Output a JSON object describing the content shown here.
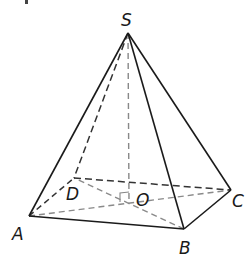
{
  "diagram": {
    "type": "square pyramid",
    "vertices": {
      "S": {
        "label": "S",
        "x": 128,
        "y": 33,
        "lx": 121,
        "ly": 26
      },
      "A": {
        "label": "A",
        "x": 29,
        "y": 216,
        "lx": 12,
        "ly": 240
      },
      "B": {
        "label": "B",
        "x": 184,
        "y": 229,
        "lx": 179,
        "ly": 254
      },
      "C": {
        "label": "C",
        "x": 231,
        "y": 190,
        "lx": 232,
        "ly": 207
      },
      "D": {
        "label": "D",
        "x": 74,
        "y": 178,
        "lx": 66,
        "ly": 200
      },
      "O": {
        "label": "O",
        "x": 129,
        "y": 202,
        "lx": 136,
        "ly": 206
      }
    },
    "solid_edges": [
      [
        "S",
        "A"
      ],
      [
        "S",
        "B"
      ],
      [
        "S",
        "C"
      ],
      [
        "A",
        "B"
      ],
      [
        "B",
        "C"
      ]
    ],
    "dashed_edges": [
      [
        "S",
        "D"
      ],
      [
        "S",
        "O"
      ],
      [
        "A",
        "D"
      ],
      [
        "D",
        "C"
      ]
    ],
    "dashed_diagonals": [
      [
        "A",
        "C"
      ],
      [
        "B",
        "D"
      ]
    ],
    "colors": {
      "solid": "#1a1a1a",
      "dashed": "#333333",
      "diagonal": "#8a8a8a"
    }
  }
}
